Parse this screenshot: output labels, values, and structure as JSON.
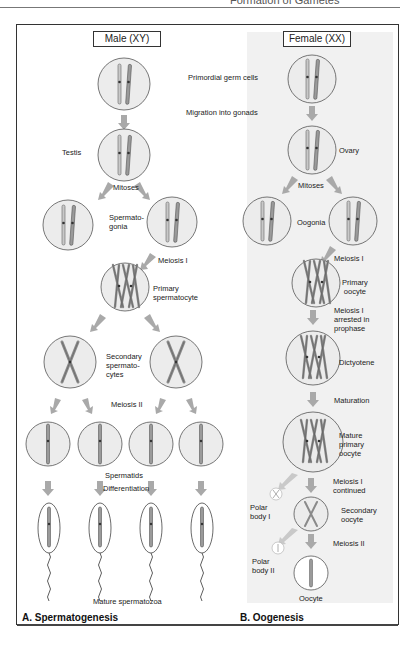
{
  "page_header": {
    "title": "Formation of Gametes"
  },
  "male": {
    "sex_label": "Male (XY)",
    "stages": {
      "testis": "Testis",
      "mitoses": "Mitoses",
      "spermatogonia_1": "Spermato-",
      "spermatogonia_2": "gonia",
      "meiosis_1": "Meiosis I",
      "primary_1": "Primary",
      "primary_2": "spermatocyte",
      "secondary_1": "Secondary",
      "secondary_2": "spermato-",
      "secondary_3": "cytes",
      "meiosis_2": "Meiosis II",
      "spermatids": "Spermatids",
      "differentiation": "Differentiation",
      "mature": "Mature spermatozoa"
    },
    "panel_title": "A. Spermatogenesis"
  },
  "shared": {
    "primordial": "Primordial germ cells",
    "migration": "Migration into gonads"
  },
  "female": {
    "sex_label": "Female (XX)",
    "stages": {
      "ovary": "Ovary",
      "mitoses": "Mitoses",
      "oogonia": "Oogonia",
      "meiosis_1": "Meiosis I",
      "primary_1": "Primary",
      "primary_2": "oocyte",
      "arrested_1": "Meiosis I",
      "arrested_2": "arrested in",
      "arrested_3": "prophase",
      "dictyotene": "Dictyotene",
      "maturation": "Maturation",
      "mature_1": "Mature",
      "mature_2": "primary",
      "mature_3": "oocyte",
      "continued_1": "Meiosis I",
      "continued_2": "continued",
      "polar1_1": "Polar",
      "polar1_2": "body I",
      "secondary_1": "Secondary",
      "secondary_2": "oocyte",
      "meiosis_2": "Meiosis II",
      "polar2_1": "Polar",
      "polar2_2": "body II",
      "oocyte": "Oocyte"
    },
    "panel_title": "B. Oogenesis"
  },
  "colors": {
    "cell_fill": "#ececec",
    "cell_stroke": "#555555",
    "arrow": "#a9a9a9",
    "chromosome": "#8c8c8c",
    "gray_panel": "#f1f1f1"
  }
}
